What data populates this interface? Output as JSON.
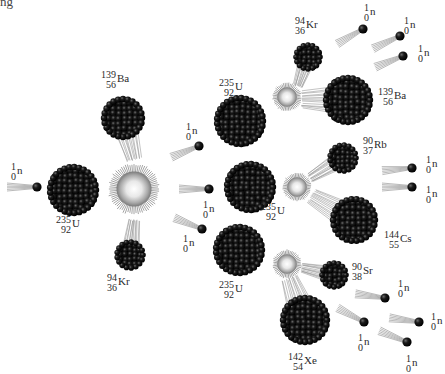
{
  "title_fragment": "ng",
  "diagram": {
    "type": "nuclear-fission-chain-reaction",
    "colors": {
      "nucleus": "#111111",
      "neutron": "#111111",
      "flash_core": "#ffffff",
      "flash_edge": "#8a8a8a",
      "trail": "#9a9a9a",
      "background": "#ffffff"
    },
    "neutrons": [
      {
        "id": "n0",
        "label": {
          "mass": "1",
          "atomic": "0",
          "symbol": "n"
        },
        "x": 37,
        "y": 187,
        "angle": 0,
        "lx": 11,
        "ly": 162
      },
      {
        "id": "n1a",
        "label": {
          "mass": "1",
          "atomic": "0",
          "symbol": "n"
        },
        "x": 199,
        "y": 146,
        "angle": -22,
        "lx": 186,
        "ly": 122
      },
      {
        "id": "n1b",
        "label": {
          "mass": "1",
          "atomic": "0",
          "symbol": "n"
        },
        "x": 209,
        "y": 189,
        "angle": 0,
        "lx": 203,
        "ly": 200
      },
      {
        "id": "n1c",
        "label": {
          "mass": "1",
          "atomic": "0",
          "symbol": "n"
        },
        "x": 202,
        "y": 229,
        "angle": 22,
        "lx": 183,
        "ly": 234
      },
      {
        "id": "n2a",
        "label": {
          "mass": "1",
          "atomic": "0",
          "symbol": "n"
        },
        "x": 363,
        "y": 29,
        "angle": -30,
        "lx": 364,
        "ly": 3
      },
      {
        "id": "n2b",
        "label": {
          "mass": "1",
          "atomic": "0",
          "symbol": "n"
        },
        "x": 400,
        "y": 36,
        "angle": -25,
        "lx": 404,
        "ly": 16
      },
      {
        "id": "n2c",
        "label": {
          "mass": "1",
          "atomic": "0",
          "symbol": "n"
        },
        "x": 403,
        "y": 56,
        "angle": -22,
        "lx": 418,
        "ly": 44
      },
      {
        "id": "n3a",
        "label": {
          "mass": "1",
          "atomic": "0",
          "symbol": "n"
        },
        "x": 412,
        "y": 168,
        "angle": -5,
        "lx": 426,
        "ly": 155
      },
      {
        "id": "n3b",
        "label": {
          "mass": "1",
          "atomic": "0",
          "symbol": "n"
        },
        "x": 412,
        "y": 187,
        "angle": 0,
        "lx": 426,
        "ly": 185
      },
      {
        "id": "n4a",
        "label": {
          "mass": "1",
          "atomic": "0",
          "symbol": "n"
        },
        "x": 385,
        "y": 298,
        "angle": 8,
        "lx": 398,
        "ly": 279
      },
      {
        "id": "n4b",
        "label": {
          "mass": "1",
          "atomic": "0",
          "symbol": "n"
        },
        "x": 364,
        "y": 322,
        "angle": 28,
        "lx": 358,
        "ly": 333
      },
      {
        "id": "n4c",
        "label": {
          "mass": "1",
          "atomic": "0",
          "symbol": "n"
        },
        "x": 419,
        "y": 322,
        "angle": 8,
        "lx": 431,
        "ly": 312
      },
      {
        "id": "n4d",
        "label": {
          "mass": "1",
          "atomic": "0",
          "symbol": "n"
        },
        "x": 407,
        "y": 342,
        "angle": 22,
        "lx": 406,
        "ly": 354
      }
    ],
    "nuclei": [
      {
        "id": "u1",
        "label": {
          "mass": "235",
          "atomic": "92",
          "symbol": "U"
        },
        "x": 73,
        "y": 190,
        "r": 24,
        "lx": 56,
        "ly": 215
      },
      {
        "id": "ba1",
        "label": {
          "mass": "139",
          "atomic": "56",
          "symbol": "Ba"
        },
        "x": 123,
        "y": 118,
        "r": 20,
        "lx": 101,
        "ly": 70,
        "trail_to": [
          134,
          160
        ]
      },
      {
        "id": "kr1",
        "label": {
          "mass": "94",
          "atomic": "36",
          "symbol": "Kr"
        },
        "x": 130,
        "y": 255,
        "r": 14,
        "lx": 107,
        "ly": 273,
        "trail_to": [
          134,
          220
        ]
      },
      {
        "id": "u2",
        "label": {
          "mass": "235",
          "atomic": "92",
          "symbol": "U"
        },
        "x": 240,
        "y": 121,
        "r": 24,
        "lx": 219,
        "ly": 78
      },
      {
        "id": "u3",
        "label": {
          "mass": "235",
          "atomic": "92",
          "symbol": "U"
        },
        "x": 250,
        "y": 187,
        "r": 24,
        "lx": 261,
        "ly": 202
      },
      {
        "id": "u4",
        "label": {
          "mass": "235",
          "atomic": "92",
          "symbol": "U"
        },
        "x": 239,
        "y": 250,
        "r": 24,
        "lx": 219,
        "ly": 280
      },
      {
        "id": "kr2",
        "label": {
          "mass": "94",
          "atomic": "36",
          "symbol": "Kr"
        },
        "x": 308,
        "y": 57,
        "r": 13,
        "lx": 295,
        "ly": 16,
        "trail_to": [
          298,
          86
        ]
      },
      {
        "id": "ba2",
        "label": {
          "mass": "139",
          "atomic": "56",
          "symbol": "Ba"
        },
        "x": 348,
        "y": 100,
        "r": 23,
        "lx": 378,
        "ly": 87,
        "trail_to": [
          302,
          100
        ]
      },
      {
        "id": "rb",
        "label": {
          "mass": "90",
          "atomic": "37",
          "symbol": "Rb"
        },
        "x": 343,
        "y": 158,
        "r": 14,
        "lx": 363,
        "ly": 136,
        "trail_to": [
          310,
          178
        ]
      },
      {
        "id": "cs",
        "label": {
          "mass": "144",
          "atomic": "55",
          "symbol": "Cs"
        },
        "x": 354,
        "y": 220,
        "r": 22,
        "lx": 384,
        "ly": 230,
        "trail_to": [
          312,
          196
        ]
      },
      {
        "id": "sr",
        "label": {
          "mass": "90",
          "atomic": "38",
          "symbol": "Sr"
        },
        "x": 334,
        "y": 275,
        "r": 13,
        "lx": 352,
        "ly": 262,
        "trail_to": [
          302,
          268
        ]
      },
      {
        "id": "xe",
        "label": {
          "mass": "142",
          "atomic": "54",
          "symbol": "Xe"
        },
        "x": 305,
        "y": 320,
        "r": 23,
        "lx": 288,
        "ly": 352,
        "trail_to": [
          290,
          278
        ]
      }
    ],
    "flashes": [
      {
        "id": "f1",
        "x": 134,
        "y": 189,
        "r": 25
      },
      {
        "id": "f2",
        "x": 287,
        "y": 97,
        "r": 14
      },
      {
        "id": "f3",
        "x": 297,
        "y": 187,
        "r": 14
      },
      {
        "id": "f4",
        "x": 287,
        "y": 264,
        "r": 14
      }
    ]
  }
}
